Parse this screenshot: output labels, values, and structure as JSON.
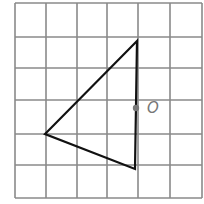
{
  "diagram": {
    "type": "grid-geometry",
    "grid": {
      "columns": 6,
      "rows": 6,
      "line_color": "#8a8a8a",
      "x_lines": [
        15,
        46,
        77,
        107,
        138,
        170,
        202
      ],
      "y_lines": [
        3,
        37,
        68,
        100,
        134,
        165,
        198
      ]
    },
    "triangle": {
      "stroke": "#111111",
      "vertices": [
        {
          "name": "top",
          "x": 137,
          "y": 41
        },
        {
          "name": "left",
          "x": 45,
          "y": 134
        },
        {
          "name": "bottom",
          "x": 135,
          "y": 169
        }
      ]
    },
    "point": {
      "label": "O",
      "x": 136,
      "y": 108,
      "color": "#777777"
    }
  }
}
